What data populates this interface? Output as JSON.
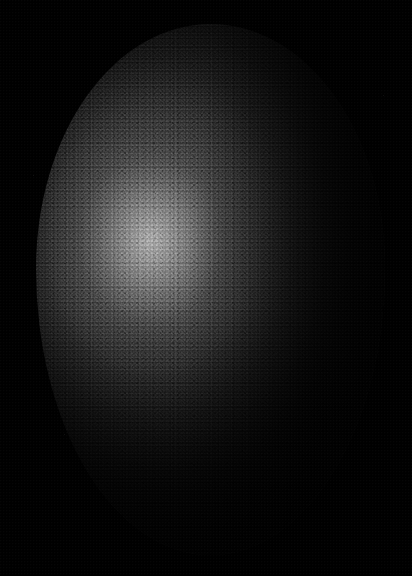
{
  "image": {
    "domain": "Natural-Image",
    "title": "Emu egg on black background",
    "subject": "emu egg",
    "alt_text": "A dark, pebbled-textured emu egg lit from the upper left, photographed against a pure black background.",
    "width": 412,
    "height": 576,
    "orientation": "portrait",
    "color_mode": "monochrome / near-monochrome"
  },
  "background": {
    "name": "black-backdrop",
    "color": "#000000",
    "description": "pure black seamless backdrop, no visible horizon or surface",
    "specks": [
      {
        "x": 33,
        "y": 175,
        "color": "#141414"
      },
      {
        "x": 64,
        "y": 434,
        "color": "#101010"
      },
      {
        "x": 383,
        "y": 95,
        "color": "#0f0f0f"
      }
    ]
  },
  "egg": {
    "name": "emu-egg",
    "bounds": {
      "left": 36,
      "top": 24,
      "width": 349,
      "height": 531
    },
    "center": {
      "x": 210,
      "y": 290
    },
    "shape": "ovoid, broader in the lower half, tapering slightly toward the top",
    "surface": {
      "texture": "fine pebbled / granular shell, grain size about 1-3 px",
      "finish": "matte with a soft broad specular sheen"
    },
    "colors": {
      "shell_dark": "#0a0a0a",
      "shell_mid": "#2a2a2a",
      "shell_light": "#767676",
      "highlight": "#c8c8c8",
      "rim_top": "#d7d7d7",
      "rim_left": "#969696",
      "rim_bottom": "#787878",
      "shadow": "#010101"
    }
  },
  "lighting": {
    "name": "lighting-setup",
    "key_light": {
      "label": "key light",
      "direction": "upper left",
      "angle_deg": 135
    },
    "specular_highlight": {
      "label": "specular highlight",
      "x": 150,
      "y": 240,
      "radius_x": 46,
      "radius_y": 52,
      "peak_value": 200
    },
    "rim_lights": [
      {
        "label": "top rim",
        "position": "top arc",
        "intensity": "bright"
      },
      {
        "label": "upper-left rim",
        "position": "upper-left arc",
        "intensity": "bright"
      },
      {
        "label": "left rim",
        "position": "left edge",
        "intensity": "medium"
      },
      {
        "label": "lower-right rim",
        "position": "lower-right arc",
        "intensity": "faint"
      }
    ],
    "shadow_side": {
      "label": "shadow falloff",
      "position": "right and lower-right",
      "description": "falls away to near black, merging with the backdrop"
    }
  }
}
